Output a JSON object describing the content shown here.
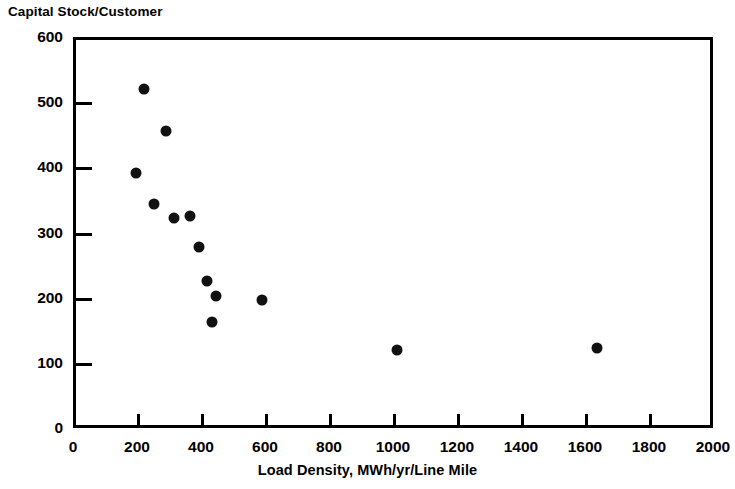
{
  "chart_data": {
    "type": "scatter",
    "title": "Capital Stock/Customer",
    "xlabel": "Load Density, MWh/yr/Line Mile",
    "ylabel": "Capital Stock/Customer",
    "xlim": [
      0,
      2000
    ],
    "ylim": [
      0,
      600
    ],
    "xticks": [
      0,
      200,
      400,
      600,
      800,
      1000,
      1200,
      1400,
      1600,
      1800,
      2000
    ],
    "yticks": [
      0,
      100,
      200,
      300,
      400,
      500,
      600
    ],
    "xtick_labels": [
      "0",
      "200",
      "400",
      "600",
      "800",
      "1000",
      "1200",
      "1400",
      "1600",
      "1800",
      "2000"
    ],
    "ytick_labels": [
      "0",
      "100",
      "200",
      "300",
      "400",
      "500",
      "600"
    ],
    "grid": false,
    "legend": null,
    "marker": "filled-circle",
    "marker_color": "#111111",
    "points": [
      {
        "x": 222,
        "y": 520
      },
      {
        "x": 290,
        "y": 456
      },
      {
        "x": 197,
        "y": 392
      },
      {
        "x": 253,
        "y": 344
      },
      {
        "x": 316,
        "y": 323
      },
      {
        "x": 366,
        "y": 325
      },
      {
        "x": 394,
        "y": 277
      },
      {
        "x": 419,
        "y": 225
      },
      {
        "x": 447,
        "y": 203
      },
      {
        "x": 434,
        "y": 163
      },
      {
        "x": 590,
        "y": 196
      },
      {
        "x": 1013,
        "y": 120
      },
      {
        "x": 1638,
        "y": 122
      }
    ]
  }
}
